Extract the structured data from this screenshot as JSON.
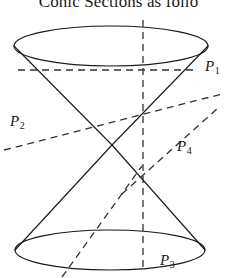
{
  "figure": {
    "caption": "Conic Sections as follo",
    "title": "Conic Sections as follo",
    "background_color": "#ffffff",
    "stroke_color": "#1a1a1a",
    "dash_color": "#333333"
  },
  "labels": {
    "p1": {
      "base": "P",
      "sub": "1",
      "name": "plane-label-p1"
    },
    "p2": {
      "base": "P",
      "sub": "2",
      "name": "plane-label-p2"
    },
    "p3": {
      "base": "P",
      "sub": "3",
      "name": "plane-label-p3"
    },
    "p4": {
      "base": "P",
      "sub": "4",
      "name": "plane-label-p4"
    }
  },
  "geometry": {
    "apex": {
      "x": 112,
      "y": 145
    },
    "top_ellipse": {
      "cx": 111,
      "cy": 46,
      "rx": 97,
      "ry": 20
    },
    "bottom_ellipse": {
      "cx": 110,
      "cy": 250,
      "rx": 95,
      "ry": 20
    },
    "axis": {
      "x": 143,
      "y_top": 20,
      "y_bottom": 272
    },
    "cutting_planes": [
      {
        "id": "P1",
        "x1": 18,
        "y1": 70,
        "x2": 196,
        "y2": 70
      },
      {
        "id": "P2",
        "x1": 4,
        "y1": 150,
        "x2": 222,
        "y2": 94
      },
      {
        "id": "P3",
        "x1": 62,
        "y1": 276,
        "x2": 142,
        "y2": 166
      },
      {
        "id": "P4",
        "x1": 122,
        "y1": 194,
        "x2": 218,
        "y2": 108
      }
    ]
  }
}
